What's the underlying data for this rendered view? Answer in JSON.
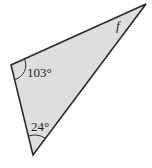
{
  "diagram": {
    "shape": "triangle",
    "fill_color": "#dedede",
    "stroke_color": "#2a2a2a",
    "vertices": {
      "top_right": [
        146,
        4
      ],
      "left": [
        11,
        65
      ],
      "bottom": [
        33,
        155
      ]
    },
    "angles": [
      {
        "vertex": "left",
        "label": "103°",
        "arc": true
      },
      {
        "vertex": "bottom",
        "label": "24°",
        "arc": true
      },
      {
        "vertex": "top_right",
        "label": "f",
        "arc": false,
        "italic": true
      }
    ]
  }
}
